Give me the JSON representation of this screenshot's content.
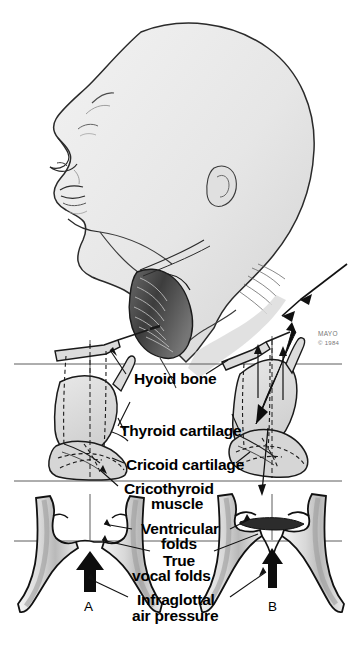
{
  "figure": {
    "credit": {
      "org": "MAYO",
      "copyright": "© 1984"
    },
    "colors": {
      "ink": "#1a1a1a",
      "line": "#333333",
      "fill_light": "#e3e3e3",
      "fill_mid": "#c9c9c9",
      "fill_dark": "#9a9a9a",
      "paper": "#ffffff",
      "shadow": "#b5b5b5"
    }
  },
  "labels": {
    "hyoid_bone": "Hyoid bone",
    "thyroid_cartilage": "Thyroid cartilage",
    "cricoid_cartilage": "Cricoid cartilage",
    "cricothyroid_muscle_line1": "Cricothyroid",
    "cricothyroid_muscle_line2": "muscle",
    "ventricular_folds_line1": "Ventricular",
    "ventricular_folds_line2": "folds",
    "true_vocal_folds_line1": "True",
    "true_vocal_folds_line2": "vocal folds",
    "infraglottal_line1": "Infraglottal",
    "infraglottal_line2": "air pressure"
  },
  "panels": [
    {
      "id": "A",
      "label": "A",
      "description": "Vocal folds adducted, low larynx position"
    },
    {
      "id": "B",
      "label": "B",
      "description": "Vocal folds with raised larynx and tilted cartilages"
    }
  ]
}
